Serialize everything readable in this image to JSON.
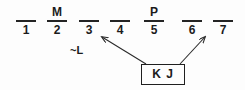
{
  "diagram": {
    "type": "fill-in-the-blank-slot-diagram",
    "background_color": "#fdfdfd",
    "ink_color": "#1b1b1b",
    "slots": [
      {
        "number": "1",
        "letter": "",
        "x": 12
      },
      {
        "number": "2",
        "letter": "M",
        "x": 43
      },
      {
        "number": "3",
        "letter": "",
        "x": 75
      },
      {
        "number": "4",
        "letter": "",
        "x": 106
      },
      {
        "number": "5",
        "letter": "P",
        "x": 140
      },
      {
        "number": "6",
        "letter": "",
        "x": 178
      },
      {
        "number": "7",
        "letter": "",
        "x": 209
      }
    ],
    "annotation": {
      "label": "~L"
    },
    "box": {
      "label": "K J"
    },
    "arrows": [
      {
        "name": "arrow-to-slot-4",
        "from_x": 146,
        "from_y": 64,
        "to_x": 101,
        "to_y": 36
      },
      {
        "name": "arrow-to-slot-6-7",
        "from_x": 180,
        "from_y": 64,
        "to_x": 206,
        "to_y": 36
      }
    ]
  }
}
